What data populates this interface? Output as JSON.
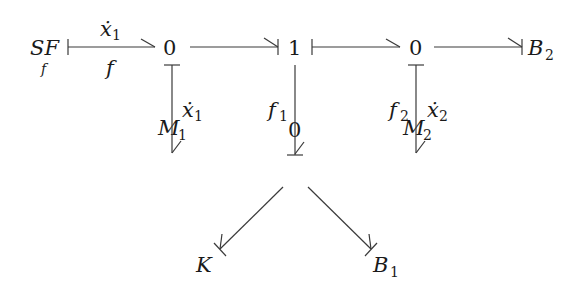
{
  "diagram": {
    "type": "bond-graph",
    "nodes": {
      "sf": {
        "main": "SF",
        "sub": "f"
      },
      "j0_left": {
        "label": "0"
      },
      "j1": {
        "label": "1"
      },
      "j0_right": {
        "label": "0"
      },
      "b2": {
        "main": "B",
        "sub": "2"
      },
      "m1": {
        "main": "M",
        "sub": "1"
      },
      "j0_bottom": {
        "label": "0"
      },
      "m2": {
        "main": "M",
        "sub": "2"
      },
      "k": {
        "label": "K"
      },
      "b1": {
        "main": "B",
        "sub": "1"
      }
    },
    "edge_labels": {
      "sf_to_0_top": {
        "main": "ẋ",
        "sub": "1"
      },
      "sf_to_0_bottom": {
        "label": "f"
      },
      "j0left_to_m1": {
        "main": "ẋ",
        "sub": "1"
      },
      "j1_to_j0bottom": {
        "main": "f",
        "sub": "1"
      },
      "j0right_to_m2_left": {
        "main": "f",
        "sub": "2"
      },
      "j0right_to_m2_right": {
        "main": "ẋ",
        "sub": "2"
      }
    },
    "edges": [
      {
        "from": "SF_f",
        "to": "0 (left)",
        "stroke_at": "source"
      },
      {
        "from": "0 (left)",
        "to": "1",
        "stroke_at": "target"
      },
      {
        "from": "1",
        "to": "0 (right)",
        "stroke_at": "source"
      },
      {
        "from": "0 (right)",
        "to": "B_2",
        "stroke_at": "target"
      },
      {
        "from": "0 (left)",
        "to": "M_1",
        "stroke_at": "source"
      },
      {
        "from": "1",
        "to": "0 (bottom)",
        "stroke_at": "target"
      },
      {
        "from": "0 (right)",
        "to": "M_2",
        "stroke_at": "source"
      },
      {
        "from": "0 (bottom)",
        "to": "K",
        "stroke_at": "target"
      },
      {
        "from": "0 (bottom)",
        "to": "B_1",
        "stroke_at": "target"
      }
    ]
  }
}
